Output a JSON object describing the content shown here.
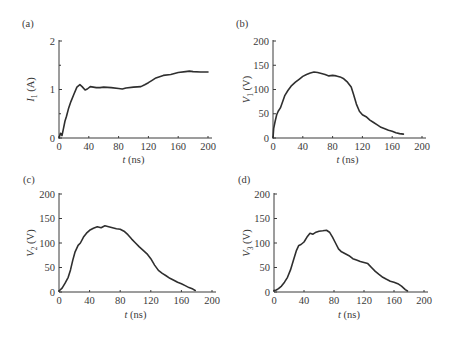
{
  "chart_data": [
    {
      "type": "line",
      "panel_label": "(a)",
      "title": "",
      "xlabel": "t (ns)",
      "ylabel": "I1 (A)",
      "ylabel_main": "I",
      "ylabel_sub": "1",
      "ylabel_unit": " (A)",
      "xlim": [
        0,
        200
      ],
      "ylim": [
        0,
        2
      ],
      "xticks": [
        0,
        40,
        80,
        120,
        160,
        200
      ],
      "xtick_labels": [
        "0",
        "40",
        "80",
        "120",
        "160",
        "200"
      ],
      "yticks": [
        0,
        1,
        2
      ],
      "ytick_labels": [
        "0",
        "1",
        "2"
      ],
      "yminor": [
        0.5,
        1.5
      ],
      "grid": false,
      "series": [
        {
          "name": "I1",
          "x": [
            0,
            2,
            4,
            6,
            8,
            10,
            13,
            16,
            20,
            24,
            28,
            31,
            35,
            38,
            42,
            46,
            50,
            55,
            60,
            70,
            80,
            85,
            90,
            100,
            110,
            115,
            120,
            125,
            130,
            140,
            150,
            160,
            170,
            175,
            180,
            190,
            200
          ],
          "y": [
            0.0,
            0.1,
            0.05,
            0.2,
            0.35,
            0.45,
            0.62,
            0.75,
            0.9,
            1.05,
            1.1,
            1.06,
            0.99,
            1.01,
            1.06,
            1.05,
            1.04,
            1.04,
            1.05,
            1.04,
            1.02,
            1.01,
            1.03,
            1.05,
            1.06,
            1.1,
            1.14,
            1.19,
            1.24,
            1.29,
            1.31,
            1.35,
            1.37,
            1.38,
            1.37,
            1.36,
            1.36
          ]
        }
      ]
    },
    {
      "type": "line",
      "panel_label": "(b)",
      "title": "",
      "xlabel": "t (ns)",
      "ylabel": "V1 (V)",
      "ylabel_main": "V",
      "ylabel_sub": "1",
      "ylabel_unit": " (V)",
      "xlim": [
        0,
        200
      ],
      "ylim": [
        0,
        200
      ],
      "xticks": [
        0,
        40,
        80,
        120,
        160,
        200
      ],
      "xtick_labels": [
        "0",
        "40",
        "80",
        "120",
        "160",
        "200"
      ],
      "yticks": [
        0,
        50,
        100,
        150,
        200
      ],
      "ytick_labels": [
        "0",
        "50",
        "100",
        "150",
        "200"
      ],
      "grid": false,
      "series": [
        {
          "name": "V1",
          "x": [
            0,
            1,
            3,
            5,
            7,
            10,
            13,
            16,
            20,
            25,
            30,
            35,
            40,
            45,
            50,
            55,
            60,
            65,
            70,
            75,
            80,
            85,
            90,
            95,
            100,
            105,
            108,
            112,
            116,
            120,
            125,
            130,
            135,
            140,
            145,
            150,
            155,
            160,
            165,
            170,
            175
          ],
          "y": [
            0,
            20,
            35,
            48,
            55,
            62,
            75,
            88,
            98,
            108,
            115,
            121,
            127,
            131,
            134,
            136,
            135,
            133,
            131,
            128,
            129,
            128,
            126,
            122,
            115,
            105,
            90,
            70,
            55,
            48,
            44,
            37,
            32,
            27,
            22,
            19,
            16,
            14,
            11,
            9,
            8
          ]
        }
      ]
    },
    {
      "type": "line",
      "panel_label": "(c)",
      "title": "",
      "xlabel": "t (ns)",
      "ylabel": "V2 (V)",
      "ylabel_main": "V",
      "ylabel_sub": "2",
      "ylabel_unit": " (V)",
      "xlim": [
        0,
        200
      ],
      "ylim": [
        0,
        200
      ],
      "xticks": [
        0,
        40,
        80,
        120,
        160,
        200
      ],
      "xtick_labels": [
        "0",
        "40",
        "80",
        "120",
        "160",
        "200"
      ],
      "yticks": [
        0,
        50,
        100,
        150,
        200
      ],
      "ytick_labels": [
        "0",
        "50",
        "100",
        "150",
        "200"
      ],
      "grid": false,
      "series": [
        {
          "name": "V2",
          "x": [
            0,
            4,
            8,
            12,
            15,
            18,
            21,
            25,
            28,
            32,
            36,
            40,
            45,
            50,
            55,
            60,
            65,
            70,
            75,
            80,
            85,
            90,
            95,
            100,
            105,
            110,
            115,
            120,
            125,
            130,
            135,
            140,
            145,
            150,
            155,
            160,
            165,
            170,
            175,
            178
          ],
          "y": [
            2,
            8,
            18,
            30,
            45,
            65,
            82,
            95,
            100,
            112,
            120,
            126,
            130,
            133,
            131,
            135,
            133,
            131,
            129,
            128,
            124,
            117,
            108,
            100,
            92,
            85,
            78,
            68,
            55,
            44,
            38,
            33,
            28,
            24,
            20,
            17,
            13,
            9,
            6,
            3
          ]
        }
      ]
    },
    {
      "type": "line",
      "panel_label": "(d)",
      "title": "",
      "xlabel": "t (ns)",
      "ylabel": "V3 (V)",
      "ylabel_main": "V",
      "ylabel_sub": "3",
      "ylabel_unit": " (V)",
      "xlim": [
        0,
        200
      ],
      "ylim": [
        0,
        200
      ],
      "xticks": [
        0,
        40,
        80,
        120,
        160,
        200
      ],
      "xtick_labels": [
        "0",
        "40",
        "80",
        "120",
        "160",
        "200"
      ],
      "yticks": [
        0,
        50,
        100,
        150,
        200
      ],
      "ytick_labels": [
        "0",
        "50",
        "100",
        "150",
        "200"
      ],
      "grid": false,
      "series": [
        {
          "name": "V3",
          "x": [
            0,
            3,
            6,
            10,
            14,
            18,
            22,
            26,
            30,
            33,
            36,
            40,
            44,
            48,
            52,
            56,
            60,
            65,
            70,
            74,
            78,
            82,
            86,
            90,
            95,
            100,
            105,
            110,
            115,
            120,
            125,
            130,
            135,
            140,
            145,
            150,
            155,
            160,
            165,
            170,
            175,
            178
          ],
          "y": [
            3,
            4,
            7,
            12,
            20,
            30,
            45,
            65,
            85,
            95,
            97,
            102,
            112,
            120,
            118,
            122,
            124,
            125,
            126,
            122,
            112,
            100,
            88,
            82,
            78,
            74,
            68,
            65,
            62,
            60,
            58,
            50,
            42,
            36,
            30,
            26,
            22,
            20,
            17,
            12,
            5,
            2
          ]
        }
      ]
    }
  ]
}
